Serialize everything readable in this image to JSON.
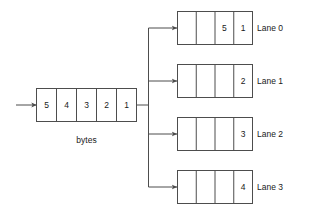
{
  "diagram": {
    "stroke_color": "#4d4d4d",
    "text_color": "#1a1a1a",
    "background_color": "#ffffff"
  },
  "source": {
    "caption": "bytes",
    "cells": [
      "5",
      "4",
      "3",
      "2",
      "1"
    ],
    "input_arrow": "input-arrow"
  },
  "lanes": [
    {
      "label": "Lane 0",
      "cells": [
        "",
        "",
        "5",
        "1"
      ],
      "arrow": "lane-0-arrow"
    },
    {
      "label": "Lane 1",
      "cells": [
        "",
        "",
        "",
        "2"
      ],
      "arrow": "lane-1-arrow"
    },
    {
      "label": "Lane 2",
      "cells": [
        "",
        "",
        "",
        "3"
      ],
      "arrow": "lane-2-arrow"
    },
    {
      "label": "Lane 3",
      "cells": [
        "",
        "",
        "",
        "4"
      ],
      "arrow": "lane-3-arrow"
    }
  ]
}
